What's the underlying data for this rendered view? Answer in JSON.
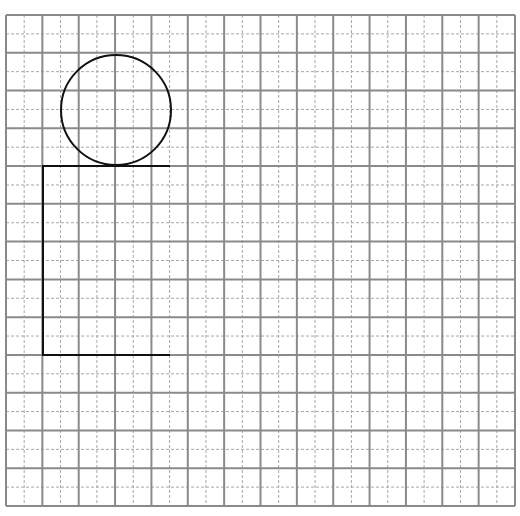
{
  "grid": {
    "x0": 6,
    "y0": 15,
    "x1": 515,
    "y1": 506,
    "cols": 14,
    "rows": 13,
    "major_color": "#8a8a8a",
    "minor_color": "#a8a8a8"
  },
  "shapes": {
    "circle": {
      "cx": 116,
      "cy": 110,
      "r": 55,
      "stroke": "#111111"
    },
    "bracket": {
      "top_y": 166,
      "bottom_y": 355,
      "left_x": 43,
      "right_x": 170,
      "stroke": "#111111"
    }
  }
}
